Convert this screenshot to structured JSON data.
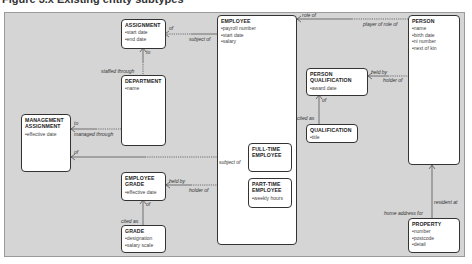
{
  "title": "Figure 3.x Existing entity subtypes",
  "colors": {
    "frame_bg": "#d5d5d5",
    "frame_border": "#9a9a9a",
    "entity_bg": "#ffffff",
    "entity_border": "#333333",
    "line": "#555555"
  },
  "entities": {
    "assignment": {
      "name": "ASSIGNMENT",
      "attributes": [
        "start date",
        "end date"
      ]
    },
    "employee": {
      "name": "EMPLOYEE",
      "attributes": [
        "payroll number",
        "start date",
        "salary"
      ]
    },
    "department": {
      "name": "DEPARTMENT",
      "attributes": [
        "name"
      ]
    },
    "management_assignment": {
      "name": "MANAGEMENT ASSIGNMENT",
      "attributes": [
        "effective date"
      ]
    },
    "full_time_employee": {
      "name": "FULL-TIME EMPLOYEE",
      "attributes": []
    },
    "part_time_employee": {
      "name": "PART-TIME EMPLOYEE",
      "attributes": [
        "weekly hours"
      ]
    },
    "employee_grade": {
      "name": "EMPLOYEE GRADE",
      "attributes": [
        "effective date"
      ]
    },
    "grade": {
      "name": "GRADE",
      "attributes": [
        "designation",
        "salary scale"
      ]
    },
    "person": {
      "name": "PERSON",
      "attributes": [
        "name",
        "birth date",
        "ni number",
        "next of kin"
      ]
    },
    "person_qualification": {
      "name": "PERSON QUALIFICATION",
      "attributes": [
        "award date"
      ]
    },
    "qualification": {
      "name": "QUALIFICATION",
      "attributes": [
        "title"
      ]
    },
    "property": {
      "name": "PROPERTY",
      "attributes": [
        "number",
        "postcode",
        "detail"
      ]
    }
  },
  "relationship_labels": {
    "assignment_of": "of",
    "employee_subject_of": "subject of",
    "assignment_to": "to",
    "department_staffed_through": "staffed through",
    "employee_role_of": "role of",
    "person_player_of_role_of": "player of role of",
    "pq_held_by": "held by",
    "person_holder_of": "holder of",
    "pq_of": "of",
    "qualification_cited_as": "cited as",
    "ma_to": "to",
    "department_managed_through": "managed through",
    "ma_of": "of",
    "fte_subject_of": "subject of",
    "eg_held_by": "held by",
    "employee_holder_of": "holder of",
    "eg_of": "of",
    "grade_cited_as": "cited as",
    "person_resident_at": "resident at",
    "property_home_address_for": "home address for"
  }
}
